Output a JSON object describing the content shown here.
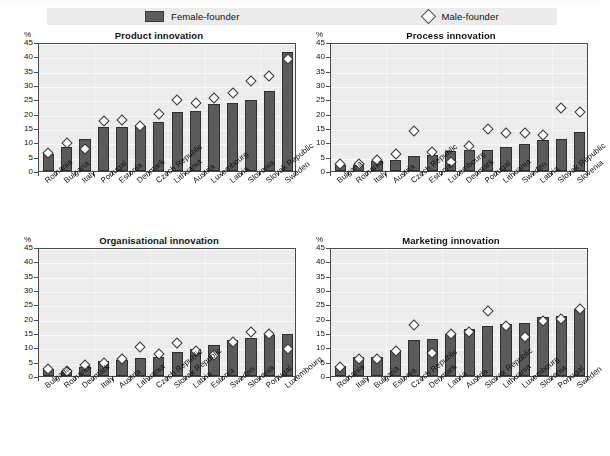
{
  "legend": {
    "female": {
      "label": "Female-founder",
      "icon": "bar-swatch",
      "color": "#5b5b5b"
    },
    "male": {
      "label": "Male-founder",
      "icon": "diamond-marker",
      "color": "#ffffff"
    }
  },
  "axis": {
    "unit": "%",
    "ticks": [
      "0",
      "5",
      "10",
      "15",
      "20",
      "25",
      "30",
      "35",
      "40",
      "45"
    ]
  },
  "chart_data": [
    {
      "type": "bar",
      "title": "Product innovation",
      "xlabel": "",
      "ylabel": "%",
      "ylim": [
        0,
        45
      ],
      "grid": true,
      "legend_position": "top",
      "categories": [
        "Romania",
        "Bulgaria",
        "Italy",
        "Portugal",
        "Estonia",
        "Denmark",
        "Czech Republic",
        "Lithuania",
        "Austria",
        "Luxembourg",
        "Latvia",
        "Slovenia",
        "Slovak Republic",
        "Sweden"
      ],
      "series": [
        {
          "name": "Female-founder",
          "type": "bar",
          "values": [
            5.9,
            8.4,
            11.2,
            15.2,
            15.5,
            15.6,
            17.1,
            20.5,
            21.0,
            23.4,
            23.9,
            24.6,
            27.8,
            41.4
          ]
        },
        {
          "name": "Male-founder",
          "type": "scatter",
          "values": [
            7.0,
            10.4,
            8.3,
            18.3,
            18.4,
            16.4,
            20.6,
            25.5,
            24.4,
            26.3,
            28.0,
            32.1,
            33.9,
            39.6
          ]
        }
      ]
    },
    {
      "type": "bar",
      "title": "Process innovation",
      "xlabel": "",
      "ylabel": "%",
      "ylim": [
        0,
        45
      ],
      "grid": true,
      "legend_position": "top",
      "categories": [
        "Bulgaria",
        "Romania",
        "Italy",
        "Austria",
        "Czech Republic",
        "Estonia",
        "Luxembourg",
        "Denmark",
        "Portugal",
        "Lithuania",
        "Sweden",
        "Latvia",
        "Slovak Republic",
        "Slovenia"
      ],
      "series": [
        {
          "name": "Female-founder",
          "type": "bar",
          "values": [
            2.1,
            2.2,
            3.4,
            3.7,
            5.4,
            5.7,
            7.1,
            7.4,
            7.5,
            8.4,
            9.3,
            10.8,
            11.2,
            13.5
          ]
        },
        {
          "name": "Male-founder",
          "type": "scatter",
          "values": [
            3.0,
            3.1,
            4.6,
            6.6,
            14.5,
            7.3,
            4.0,
            9.4,
            15.3,
            13.9,
            13.9,
            13.2,
            22.8,
            21.2
          ]
        }
      ]
    },
    {
      "type": "bar",
      "title": "Organisational innovation",
      "xlabel": "",
      "ylabel": "%",
      "ylim": [
        0,
        45
      ],
      "grid": true,
      "legend_position": "top",
      "categories": [
        "Bulgaria",
        "Romania",
        "Denmark",
        "Italy",
        "Austria",
        "Lithuania",
        "Czech Republic",
        "Slovak Republic",
        "Latvia",
        "Estonia",
        "Sweden",
        "Slovenia",
        "Portugal",
        "Luxembourg"
      ],
      "series": [
        {
          "name": "Female-founder",
          "type": "bar",
          "values": [
            2.4,
            1.9,
            3.2,
            5.2,
            5.6,
            6.3,
            6.6,
            8.5,
            9.4,
            10.8,
            12.5,
            13.1,
            14.4,
            14.5
          ]
        },
        {
          "name": "Male-founder",
          "type": "scatter",
          "values": [
            3.0,
            2.3,
            4.6,
            5.3,
            6.8,
            10.7,
            8.4,
            12.3,
            9.5,
            7.9,
            12.4,
            15.9,
            15.2,
            10.1
          ]
        }
      ]
    },
    {
      "type": "bar",
      "title": "Marketing innovation",
      "xlabel": "",
      "ylabel": "%",
      "ylim": [
        0,
        45
      ],
      "grid": true,
      "legend_position": "top",
      "categories": [
        "Romania",
        "Italy",
        "Bulgaria",
        "Estonia",
        "Czech Republic",
        "Denmark",
        "Latvia",
        "Austria",
        "Slovak Republic",
        "Lithuania",
        "Luxembourg",
        "Slovenia",
        "Portugal",
        "Sweden"
      ],
      "series": [
        {
          "name": "Female-founder",
          "type": "bar",
          "values": [
            3.6,
            6.5,
            6.6,
            9.0,
            12.7,
            13.0,
            14.6,
            16.5,
            17.4,
            18.1,
            18.4,
            20.6,
            21.0,
            23.4
          ]
        },
        {
          "name": "Male-founder",
          "type": "scatter",
          "values": [
            3.9,
            6.7,
            6.7,
            9.4,
            18.4,
            8.6,
            15.4,
            16.1,
            23.2,
            18.0,
            14.3,
            20.0,
            20.6,
            24.0
          ]
        }
      ]
    }
  ]
}
